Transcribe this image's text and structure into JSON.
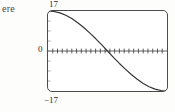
{
  "figure": {
    "margin_text": "ere",
    "labels": {
      "y_max": "17",
      "y_zero": "0",
      "y_min": "−17"
    },
    "colors": {
      "curve": "#333333",
      "frame": "#4c4c4c",
      "axis": "#3a3a3a",
      "text": "#2b2b2b"
    }
  },
  "chart_data": {
    "type": "line",
    "title": "",
    "subtitle": "",
    "xlabel": "",
    "ylabel": "",
    "ylim": [
      -17,
      17
    ],
    "xlim": [
      0,
      1
    ],
    "grid": false,
    "legend": false,
    "legend_position": "none",
    "y_ticks": [
      17,
      0,
      -17
    ],
    "y_tick_labels": [
      "17",
      "0",
      "−17"
    ],
    "x_ticks": [],
    "x_tick_labels": [],
    "x_tick_count": 25,
    "axis_line_y": 0,
    "annotations": [],
    "series": [
      {
        "name": "curve",
        "shape": "cosine-like decreasing S-curve from +17 to -17",
        "x": [
          0.0,
          0.05,
          0.1,
          0.15,
          0.2,
          0.25,
          0.3,
          0.35,
          0.4,
          0.45,
          0.5,
          0.55,
          0.6,
          0.65,
          0.7,
          0.75,
          0.8,
          0.85,
          0.9,
          0.95,
          1.0
        ],
        "values": [
          17.0,
          16.8,
          16.2,
          15.2,
          13.8,
          12.0,
          10.0,
          7.7,
          5.3,
          2.7,
          0.0,
          -2.7,
          -5.3,
          -7.7,
          -10.0,
          -12.0,
          -13.8,
          -15.2,
          -16.2,
          -16.8,
          -17.0
        ]
      }
    ]
  }
}
